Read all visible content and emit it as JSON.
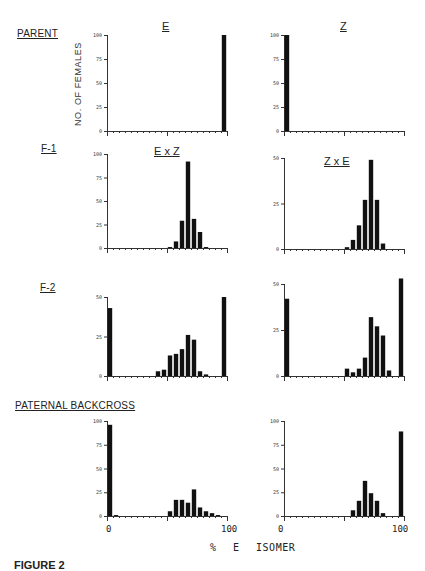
{
  "labels": {
    "row_parent": "PARENT",
    "row_f1": "F-1",
    "row_f2": "F-2",
    "row_backcross": "PATERNAL BACKCROSS",
    "col_e": "E",
    "col_z": "Z",
    "cross_exz": "E x Z",
    "cross_zxe": "Z x E",
    "ylabel": "NO. OF FEMALES",
    "xlabel": "% E ISOMER",
    "x0_left": "0",
    "x100_left": "100",
    "x0_right": "0",
    "x100_right": "100",
    "caption": "FIGURE 2"
  },
  "colors": {
    "bar": "#111111",
    "axis": "#333333"
  },
  "chart_data": [
    {
      "id": "parent-e",
      "type": "bar",
      "title": "E",
      "row": "PARENT",
      "xlabel": "% E ISOMER",
      "ylabel": "NO. OF FEMALES",
      "xlim": [
        0,
        100
      ],
      "ylim": [
        0,
        100
      ],
      "yticks": [
        0,
        25,
        50,
        75,
        100
      ],
      "bin_width": 5,
      "bins": [
        0,
        5,
        10,
        15,
        20,
        25,
        30,
        35,
        40,
        45,
        50,
        55,
        60,
        65,
        70,
        75,
        80,
        85,
        90,
        95
      ],
      "values": [
        0,
        0,
        0,
        0,
        0,
        0,
        0,
        0,
        0,
        0,
        0,
        0,
        0,
        0,
        0,
        0,
        0,
        0,
        0,
        100
      ]
    },
    {
      "id": "parent-z",
      "type": "bar",
      "title": "Z",
      "row": "PARENT",
      "xlabel": "% E ISOMER",
      "ylabel": "NO. OF FEMALES",
      "xlim": [
        0,
        100
      ],
      "ylim": [
        0,
        100
      ],
      "yticks": [
        0,
        25,
        50,
        75,
        100
      ],
      "bin_width": 5,
      "bins": [
        0,
        5,
        10,
        15,
        20,
        25,
        30,
        35,
        40,
        45,
        50,
        55,
        60,
        65,
        70,
        75,
        80,
        85,
        90,
        95
      ],
      "values": [
        100,
        0,
        0,
        0,
        0,
        0,
        0,
        0,
        0,
        0,
        0,
        0,
        0,
        0,
        0,
        0,
        0,
        0,
        0,
        0
      ]
    },
    {
      "id": "f1-exz",
      "type": "bar",
      "title": "E x Z",
      "row": "F-1",
      "xlabel": "% E ISOMER",
      "ylabel": "NO. OF FEMALES",
      "xlim": [
        0,
        100
      ],
      "ylim": [
        0,
        100
      ],
      "yticks": [
        0,
        25,
        50,
        75,
        100
      ],
      "bin_width": 5,
      "bins": [
        0,
        5,
        10,
        15,
        20,
        25,
        30,
        35,
        40,
        45,
        50,
        55,
        60,
        65,
        70,
        75,
        80,
        85,
        90,
        95
      ],
      "values": [
        0,
        0,
        0,
        0,
        0,
        0,
        0,
        0,
        0,
        0,
        1,
        7,
        29,
        92,
        31,
        17,
        1,
        0,
        0,
        0
      ]
    },
    {
      "id": "f1-zxe",
      "type": "bar",
      "title": "Z x E",
      "row": "F-1",
      "xlabel": "% E ISOMER",
      "ylabel": "NO. OF FEMALES",
      "xlim": [
        0,
        100
      ],
      "ylim": [
        0,
        50
      ],
      "yticks": [
        0,
        25,
        50
      ],
      "bin_width": 5,
      "bins": [
        0,
        5,
        10,
        15,
        20,
        25,
        30,
        35,
        40,
        45,
        50,
        55,
        60,
        65,
        70,
        75,
        80,
        85,
        90,
        95
      ],
      "values": [
        0,
        0,
        0,
        0,
        0,
        0,
        0,
        0,
        0,
        0,
        1,
        5,
        13,
        27,
        49,
        27,
        3,
        0,
        0,
        0
      ]
    },
    {
      "id": "f2-exz",
      "type": "bar",
      "title": "E x Z",
      "row": "F-2",
      "xlabel": "% E ISOMER",
      "ylabel": "NO. OF FEMALES",
      "xlim": [
        0,
        100
      ],
      "ylim": [
        0,
        50
      ],
      "yticks": [
        0,
        25,
        50
      ],
      "bin_width": 5,
      "bins": [
        0,
        5,
        10,
        15,
        20,
        25,
        30,
        35,
        40,
        45,
        50,
        55,
        60,
        65,
        70,
        75,
        80,
        85,
        90,
        95
      ],
      "values": [
        43,
        0,
        0,
        0,
        0,
        0,
        0,
        0,
        3,
        4,
        13,
        14,
        17,
        26,
        23,
        3,
        1,
        0,
        0,
        50
      ]
    },
    {
      "id": "f2-zxe",
      "type": "bar",
      "title": "Z x E",
      "row": "F-2",
      "xlabel": "% E ISOMER",
      "ylabel": "NO. OF FEMALES",
      "xlim": [
        0,
        100
      ],
      "ylim": [
        0,
        50
      ],
      "yticks": [
        0,
        25,
        50
      ],
      "bin_width": 5,
      "bins": [
        0,
        5,
        10,
        15,
        20,
        25,
        30,
        35,
        40,
        45,
        50,
        55,
        60,
        65,
        70,
        75,
        80,
        85,
        90,
        95
      ],
      "values": [
        42,
        0,
        0,
        0,
        0,
        0,
        0,
        0,
        0,
        0,
        4,
        2,
        4,
        10,
        32,
        27,
        22,
        3,
        0,
        53
      ]
    },
    {
      "id": "backcross-left",
      "type": "bar",
      "title": "",
      "row": "PATERNAL BACKCROSS",
      "xlabel": "% E ISOMER",
      "ylabel": "NO. OF FEMALES",
      "xlim": [
        0,
        100
      ],
      "ylim": [
        0,
        100
      ],
      "yticks": [
        0,
        25,
        50,
        75,
        100
      ],
      "bin_width": 5,
      "bins": [
        0,
        5,
        10,
        15,
        20,
        25,
        30,
        35,
        40,
        45,
        50,
        55,
        60,
        65,
        70,
        75,
        80,
        85,
        90,
        95
      ],
      "values": [
        96,
        1,
        0,
        0,
        0,
        0,
        0,
        0,
        0,
        0,
        5,
        17,
        17,
        14,
        28,
        9,
        5,
        3,
        1,
        0
      ]
    },
    {
      "id": "backcross-right",
      "type": "bar",
      "title": "",
      "row": "PATERNAL BACKCROSS",
      "xlabel": "% E ISOMER",
      "ylabel": "NO. OF FEMALES",
      "xlim": [
        0,
        100
      ],
      "ylim": [
        0,
        100
      ],
      "yticks": [
        0,
        25,
        50,
        75,
        100
      ],
      "bin_width": 5,
      "bins": [
        0,
        5,
        10,
        15,
        20,
        25,
        30,
        35,
        40,
        45,
        50,
        55,
        60,
        65,
        70,
        75,
        80,
        85,
        90,
        95
      ],
      "values": [
        0,
        0,
        0,
        0,
        0,
        0,
        0,
        0,
        0,
        0,
        0,
        6,
        16,
        37,
        24,
        16,
        3,
        0,
        0,
        89
      ]
    }
  ]
}
